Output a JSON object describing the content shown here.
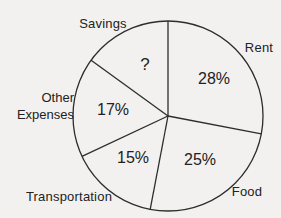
{
  "chart_data": {
    "type": "pie",
    "title": "",
    "start_angle": "top",
    "direction": "clockwise",
    "slices": [
      {
        "label": "Rent",
        "value": 28,
        "value_label": "28%"
      },
      {
        "label": "Food",
        "value": 25,
        "value_label": "25%"
      },
      {
        "label": "Transportation",
        "value": 15,
        "value_label": "15%"
      },
      {
        "label": "Other Expenses",
        "value": 17,
        "value_label": "17%"
      },
      {
        "label": "Savings",
        "value": 15,
        "value_label": "?"
      }
    ],
    "colors": {
      "background": "#f2f1ef",
      "stroke": "#2d2d2d",
      "text": "#222222"
    }
  }
}
